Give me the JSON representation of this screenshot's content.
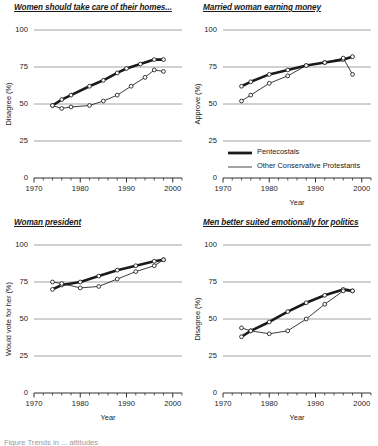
{
  "figure": {
    "caption": "Figure    Trends in ... attitudes",
    "legend": {
      "items": [
        {
          "label": "Pentecostals",
          "style": "thick-black-line",
          "color": "#1a1a1a"
        },
        {
          "label": "Other Conservative Protestants",
          "style": "thin-line-open-circles",
          "color": "#333333"
        }
      ]
    }
  },
  "chart_data": [
    {
      "type": "line",
      "panel": "top-left",
      "title": "Women should take care of their homes...",
      "xlabel": "",
      "ylabel": "Disagree (%)",
      "xlim": [
        1970,
        2002
      ],
      "ylim": [
        0,
        100
      ],
      "yticks": [
        0,
        25,
        50,
        75,
        100
      ],
      "xticks": [
        1970,
        1980,
        1990,
        2000
      ],
      "xtick_minor_step": 2,
      "grid": true,
      "series": [
        {
          "name": "Pentecostals",
          "x": [
            1974,
            1976,
            1978,
            1982,
            1985,
            1988,
            1990,
            1993,
            1996,
            1998
          ],
          "values": [
            49,
            53,
            56,
            62,
            66,
            71,
            74,
            77,
            80,
            80
          ]
        },
        {
          "name": "Other Conservative Protestants",
          "x": [
            1974,
            1976,
            1978,
            1982,
            1985,
            1988,
            1991,
            1994,
            1996,
            1998
          ],
          "values": [
            49,
            47,
            48,
            49,
            52,
            56,
            62,
            68,
            73,
            72
          ]
        }
      ]
    },
    {
      "type": "line",
      "panel": "top-right",
      "title": "Married woman earning money",
      "xlabel": "Year",
      "ylabel": "Approve (%)",
      "xlim": [
        1970,
        2002
      ],
      "ylim": [
        0,
        100
      ],
      "yticks": [
        0,
        25,
        50,
        75,
        100
      ],
      "xticks": [
        1970,
        1980,
        1990,
        2000
      ],
      "xtick_minor_step": 2,
      "grid": true,
      "series": [
        {
          "name": "Pentecostals",
          "x": [
            1974,
            1976,
            1980,
            1984,
            1988,
            1992,
            1996,
            1998
          ],
          "values": [
            62,
            65,
            70,
            73,
            76,
            78,
            80,
            82
          ]
        },
        {
          "name": "Other Conservative Protestants",
          "x": [
            1974,
            1976,
            1980,
            1984,
            1988,
            1992,
            1996,
            1998
          ],
          "values": [
            52,
            56,
            64,
            69,
            76,
            78,
            81,
            70
          ]
        }
      ]
    },
    {
      "type": "line",
      "panel": "bottom-left",
      "title": "Woman president",
      "xlabel": "Year",
      "ylabel": "Would vote for her (%)",
      "xlim": [
        1970,
        2002
      ],
      "ylim": [
        0,
        100
      ],
      "yticks": [
        0,
        25,
        50,
        75,
        100
      ],
      "xticks": [
        1970,
        1980,
        1990,
        2000
      ],
      "xtick_minor_step": 2,
      "grid": true,
      "series": [
        {
          "name": "Pentecostals",
          "x": [
            1974,
            1976,
            1980,
            1984,
            1988,
            1992,
            1996,
            1998
          ],
          "values": [
            70,
            73,
            75,
            79,
            83,
            86,
            89,
            90
          ]
        },
        {
          "name": "Other Conservative Protestants",
          "x": [
            1974,
            1976,
            1980,
            1984,
            1988,
            1992,
            1996,
            1998
          ],
          "values": [
            75,
            74,
            71,
            72,
            77,
            82,
            86,
            90
          ]
        }
      ]
    },
    {
      "type": "line",
      "panel": "bottom-right",
      "title": "Men better suited emotionally for politics",
      "xlabel": "Year",
      "ylabel": "Disagree (%)",
      "xlim": [
        1970,
        2002
      ],
      "ylim": [
        0,
        100
      ],
      "yticks": [
        0,
        25,
        50,
        75,
        100
      ],
      "xticks": [
        1970,
        1980,
        1990,
        2000
      ],
      "xtick_minor_step": 2,
      "grid": true,
      "series": [
        {
          "name": "Pentecostals",
          "x": [
            1974,
            1976,
            1980,
            1984,
            1988,
            1992,
            1996,
            1998
          ],
          "values": [
            38,
            42,
            48,
            55,
            61,
            66,
            70,
            69
          ]
        },
        {
          "name": "Other Conservative Protestants",
          "x": [
            1974,
            1976,
            1980,
            1984,
            1988,
            1992,
            1996,
            1998
          ],
          "values": [
            44,
            42,
            40,
            42,
            50,
            60,
            69,
            69
          ]
        }
      ]
    }
  ]
}
